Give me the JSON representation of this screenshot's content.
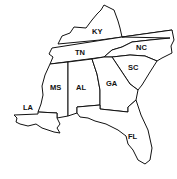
{
  "map": {
    "region": "Southeastern United States",
    "states": [
      {
        "abbr": "KY",
        "x": 92,
        "y": 34
      },
      {
        "abbr": "TN",
        "x": 75,
        "y": 55
      },
      {
        "abbr": "NC",
        "x": 136,
        "y": 50
      },
      {
        "abbr": "SC",
        "x": 128,
        "y": 70
      },
      {
        "abbr": "MS",
        "x": 50,
        "y": 90
      },
      {
        "abbr": "AL",
        "x": 76,
        "y": 90
      },
      {
        "abbr": "GA",
        "x": 106,
        "y": 86
      },
      {
        "abbr": "LA",
        "x": 23,
        "y": 110
      },
      {
        "abbr": "FL",
        "x": 128,
        "y": 139
      }
    ],
    "colors": {
      "stroke": "#111111",
      "fill": "#ffffff"
    }
  }
}
